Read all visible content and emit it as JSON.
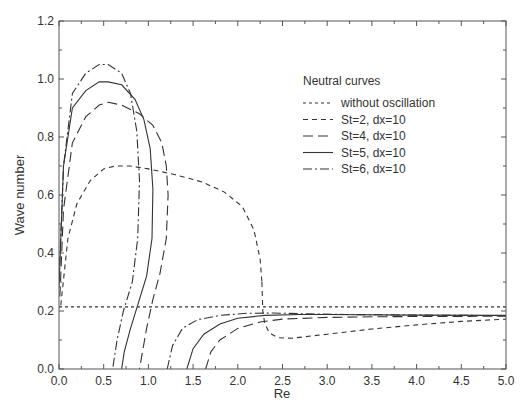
{
  "chart_data": {
    "type": "line",
    "title": "",
    "xlabel": "Re",
    "ylabel": "Wave number",
    "xlim": [
      0.0,
      5.0
    ],
    "ylim": [
      0.0,
      1.2
    ],
    "xticks": [
      "0.0",
      "0.5",
      "1.0",
      "1.5",
      "2.0",
      "2.5",
      "3.0",
      "3.5",
      "4.0",
      "4.5",
      "5.0"
    ],
    "yticks": [
      "0.0",
      "0.2",
      "0.4",
      "0.6",
      "0.8",
      "1.0",
      "1.2"
    ],
    "grid": false,
    "legend": {
      "title": "Neutral curves",
      "position": "upper right (inside)",
      "entries": [
        "without oscillation",
        "St=2, dx=10",
        "St=4, dx=10",
        "St=5, dx=10",
        "St=6, dx=10"
      ]
    },
    "series": [
      {
        "name": "without oscillation",
        "style": "dotted",
        "x": [
          0.0,
          5.0
        ],
        "y": [
          0.214,
          0.214
        ]
      },
      {
        "name": "St=2, dx=10",
        "style": "short-dash",
        "upper_branch": {
          "x": [
            0.02,
            0.1,
            0.2,
            0.35,
            0.5,
            0.63,
            0.8,
            1.0,
            1.3,
            1.6,
            1.85,
            2.05,
            2.18,
            2.25,
            2.27
          ],
          "y": [
            0.22,
            0.45,
            0.57,
            0.65,
            0.69,
            0.7,
            0.7,
            0.69,
            0.67,
            0.645,
            0.61,
            0.56,
            0.48,
            0.38,
            0.3
          ]
        },
        "lower_branch": {
          "x": [
            2.27,
            2.28,
            2.3,
            2.35,
            2.45,
            2.6,
            3.0,
            3.5,
            4.0,
            4.5,
            5.0
          ],
          "y": [
            0.3,
            0.2,
            0.16,
            0.125,
            0.108,
            0.106,
            0.12,
            0.138,
            0.152,
            0.164,
            0.172
          ]
        }
      },
      {
        "name": "St=4, dx=10",
        "style": "long-dash",
        "upper_branch": {
          "x": [
            0.01,
            0.05,
            0.15,
            0.3,
            0.45,
            0.55,
            0.7,
            0.9,
            1.05,
            1.15,
            1.2,
            1.22,
            1.2,
            1.13,
            1.05,
            0.98,
            0.9
          ],
          "y": [
            0.25,
            0.55,
            0.78,
            0.87,
            0.91,
            0.92,
            0.91,
            0.88,
            0.84,
            0.78,
            0.7,
            0.6,
            0.45,
            0.33,
            0.24,
            0.14,
            0.0
          ]
        },
        "lower_branch": {
          "x": [
            1.64,
            1.7,
            1.8,
            2.0,
            2.25,
            2.5,
            3.0,
            3.5,
            4.0,
            5.0
          ],
          "y": [
            0.0,
            0.06,
            0.1,
            0.14,
            0.162,
            0.172,
            0.178,
            0.18,
            0.181,
            0.182
          ]
        }
      },
      {
        "name": "St=5, dx=10",
        "style": "solid",
        "upper_branch": {
          "x": [
            0.0,
            0.05,
            0.15,
            0.3,
            0.45,
            0.55,
            0.7,
            0.85,
            0.95,
            1.02,
            1.05,
            1.04,
            0.98,
            0.88,
            0.8,
            0.73,
            0.7
          ],
          "y": [
            0.28,
            0.7,
            0.9,
            0.96,
            0.99,
            0.99,
            0.98,
            0.93,
            0.86,
            0.76,
            0.62,
            0.45,
            0.32,
            0.22,
            0.14,
            0.06,
            0.0
          ]
        },
        "lower_branch": {
          "x": [
            1.43,
            1.5,
            1.62,
            1.8,
            2.0,
            2.3,
            2.7,
            3.0,
            4.0,
            5.0
          ],
          "y": [
            0.0,
            0.07,
            0.12,
            0.155,
            0.175,
            0.185,
            0.188,
            0.188,
            0.186,
            0.185
          ]
        }
      },
      {
        "name": "St=6, dx=10",
        "style": "dash-dot",
        "upper_branch": {
          "x": [
            0.0,
            0.05,
            0.15,
            0.3,
            0.45,
            0.55,
            0.7,
            0.8,
            0.87,
            0.9,
            0.88,
            0.82,
            0.72,
            0.65,
            0.6
          ],
          "y": [
            0.3,
            0.7,
            0.95,
            1.02,
            1.05,
            1.05,
            1.02,
            0.95,
            0.82,
            0.65,
            0.45,
            0.3,
            0.2,
            0.1,
            0.0
          ]
        },
        "lower_branch": {
          "x": [
            1.21,
            1.27,
            1.38,
            1.55,
            1.8,
            2.1,
            2.4,
            2.8,
            3.2,
            4.0,
            5.0
          ],
          "y": [
            0.0,
            0.08,
            0.14,
            0.17,
            0.185,
            0.192,
            0.193,
            0.19,
            0.188,
            0.186,
            0.184
          ]
        }
      }
    ]
  },
  "caption": {
    "text": ""
  }
}
